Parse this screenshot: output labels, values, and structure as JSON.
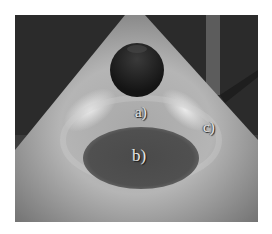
{
  "scene": {
    "description": "Rendered scene: sphere under a cone of light casting a shadow onto the floor",
    "labels": {
      "a": "a)",
      "b": "b)",
      "c": "c)"
    },
    "colors": {
      "background": "#2b2b2b",
      "cone_light": "#b8b8b8",
      "cone_highlight": "#e0e0e0",
      "sphere": "#1c1c1c",
      "shadow": "#4a4a4a",
      "pillar": "#6a6a6a"
    }
  }
}
